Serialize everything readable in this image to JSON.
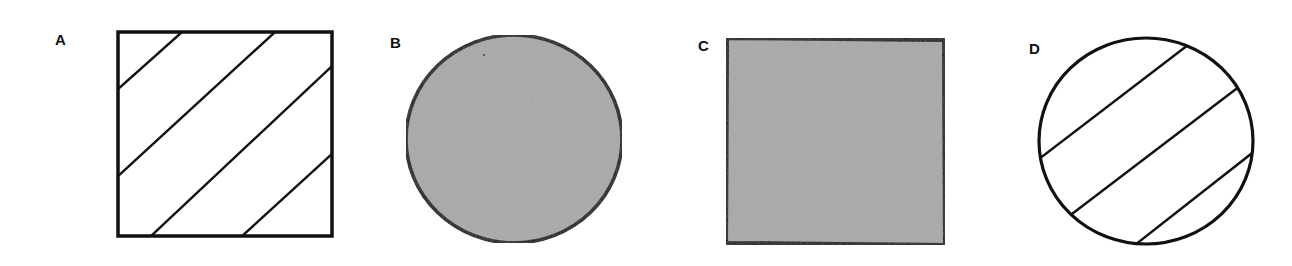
{
  "figures": [
    {
      "label": "A",
      "shape": "square",
      "fill": "diagonal-hatch",
      "fill_color": "#ffffff",
      "stroke_color": "#111111"
    },
    {
      "label": "B",
      "shape": "circle",
      "fill": "solid-gray",
      "fill_color": "#a9a9a9",
      "stroke_color": "#111111"
    },
    {
      "label": "C",
      "shape": "square",
      "fill": "solid-gray",
      "fill_color": "#a9a9a9",
      "stroke_color": "#111111"
    },
    {
      "label": "D",
      "shape": "circle",
      "fill": "diagonal-hatch",
      "fill_color": "#ffffff",
      "stroke_color": "#111111"
    }
  ]
}
